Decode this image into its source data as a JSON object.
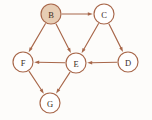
{
  "figure": {
    "kind": "directed-graph",
    "width": 152,
    "height": 120,
    "background_color": "#fdfcfa",
    "edge_color": "#a8674a",
    "node_stroke_color": "#a8674a",
    "node_fill_default": "#ffffff",
    "node_fill_highlight": "#e7cdb4",
    "label_color": "#3b2b22",
    "node_radius": 10
  },
  "nodes": [
    {
      "id": "B",
      "label": "B",
      "cx": 51,
      "cy": 14,
      "r": 10,
      "fill": "#e7cdb4",
      "highlighted": true
    },
    {
      "id": "C",
      "label": "C",
      "cx": 104,
      "cy": 14,
      "r": 10,
      "fill": "#ffffff",
      "highlighted": false
    },
    {
      "id": "F",
      "label": "F",
      "cx": 23,
      "cy": 62,
      "r": 10,
      "fill": "#ffffff",
      "highlighted": false
    },
    {
      "id": "E",
      "label": "E",
      "cx": 76,
      "cy": 63,
      "r": 10,
      "fill": "#ffffff",
      "highlighted": false
    },
    {
      "id": "D",
      "label": "D",
      "cx": 128,
      "cy": 62,
      "r": 10,
      "fill": "#ffffff",
      "highlighted": false
    },
    {
      "id": "G",
      "label": "G",
      "cx": 50,
      "cy": 103,
      "r": 10,
      "fill": "#ffffff",
      "highlighted": false
    }
  ],
  "edges": [
    {
      "id": "B-C",
      "from": "B",
      "to": "C",
      "directed": true
    },
    {
      "id": "B-F",
      "from": "B",
      "to": "F",
      "directed": true
    },
    {
      "id": "B-E",
      "from": "B",
      "to": "E",
      "directed": true
    },
    {
      "id": "C-E",
      "from": "C",
      "to": "E",
      "directed": true
    },
    {
      "id": "C-D",
      "from": "C",
      "to": "D",
      "directed": true
    },
    {
      "id": "D-E",
      "from": "D",
      "to": "E",
      "directed": true
    },
    {
      "id": "E-F",
      "from": "E",
      "to": "F",
      "directed": true
    },
    {
      "id": "E-G",
      "from": "E",
      "to": "G",
      "directed": true
    },
    {
      "id": "F-G",
      "from": "F",
      "to": "G",
      "directed": true
    }
  ]
}
